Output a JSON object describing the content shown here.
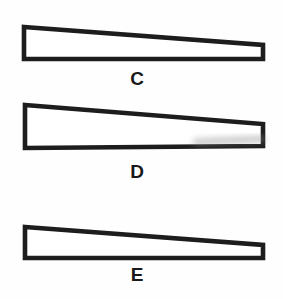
{
  "figure": {
    "background_color": "#fefefe",
    "ink_color": "#1d1d1d",
    "stroke_width": 4.6,
    "width": 283,
    "height": 299,
    "shapes": [
      {
        "id": "shape-c",
        "label": "C",
        "kind": "tapered-quadrilateral",
        "description": "Long thin wedge, thick left end tapering to thin right end, flat horizontal bottom edge",
        "points": "24,27 263,45 263,59 24,59",
        "label_x": 137,
        "label_y": 85,
        "bbox": {
          "x": 22,
          "y": 25,
          "width": 243,
          "height": 36
        }
      },
      {
        "id": "shape-d",
        "label": "D",
        "kind": "wedge-triangle",
        "description": "Wedge with tall vertical left edge; top edge slopes down to the right and bottom edge slopes up to the right, converging at a short right end",
        "points": "25,105 263,124 263,146 25,148",
        "label_x": 137,
        "label_y": 178,
        "bbox": {
          "x": 23,
          "y": 103,
          "width": 242,
          "height": 47
        },
        "smudge": {
          "present": true,
          "description": "faint gray blurred smear along the lower-right interior edge",
          "color": "#8f8f8f",
          "path": "M 196,142 L 262,139"
        }
      },
      {
        "id": "shape-e",
        "label": "E",
        "kind": "tapered-quadrilateral",
        "description": "Long thin wedge, thick left end tapering to thin right end, flat horizontal bottom edge",
        "points": "25,227 263,245 263,258 25,258",
        "label_x": 137,
        "label_y": 281,
        "bbox": {
          "x": 23,
          "y": 225,
          "width": 242,
          "height": 35
        }
      }
    ]
  }
}
